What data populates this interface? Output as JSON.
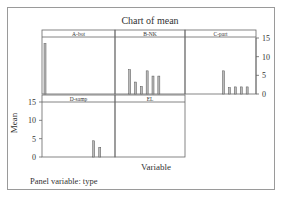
{
  "chart_data": {
    "type": "bar",
    "title": "Chart of mean",
    "xlabel": "Variable",
    "ylabel": "Mean",
    "footnote": "Panel variable: type",
    "ylim": [
      0,
      15
    ],
    "yticks": [
      0,
      5,
      10,
      15
    ],
    "panels": [
      {
        "name": "A-bot",
        "values": [
          13.5
        ]
      },
      {
        "name": "B-NK",
        "values": [
          6.5,
          3.2,
          2.0,
          6.2,
          4.8,
          4.8
        ]
      },
      {
        "name": "C-part",
        "values": [
          6.2,
          1.7,
          1.9,
          1.9,
          1.9
        ]
      },
      {
        "name": "D-samp",
        "values": [
          4.5,
          2.7
        ]
      },
      {
        "name": "EL",
        "values": []
      }
    ]
  }
}
